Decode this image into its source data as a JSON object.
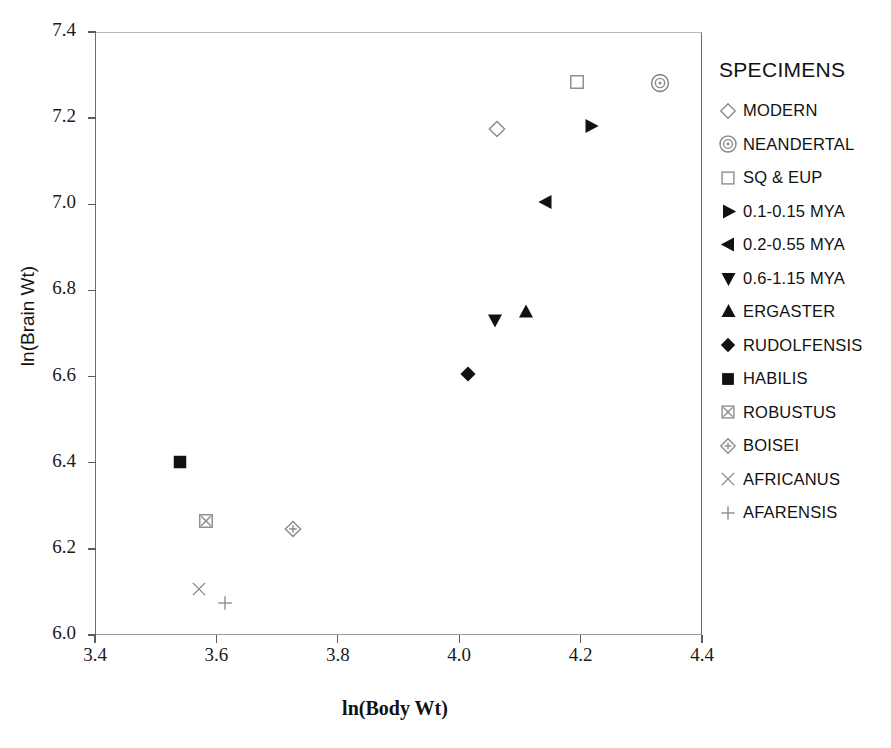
{
  "chart_data": {
    "type": "scatter",
    "title": "",
    "xlabel": "ln(Body Wt)",
    "ylabel": "ln(Brain Wt)",
    "xlim": [
      3.4,
      4.4
    ],
    "ylim": [
      6.0,
      7.4
    ],
    "xticks": [
      "3.4",
      "3.6",
      "3.8",
      "4.0",
      "4.2",
      "4.4"
    ],
    "yticks": [
      "6.0",
      "6.2",
      "6.4",
      "6.6",
      "6.8",
      "7.0",
      "7.2",
      "7.4"
    ],
    "grid": false,
    "legend_position": "right",
    "legend_title": "SPECIMENS",
    "series": [
      {
        "name": "MODERN",
        "marker": "diamond-open",
        "filled": false,
        "points": [
          {
            "x": 4.062,
            "y": 7.17
          }
        ]
      },
      {
        "name": "NEANDERTAL",
        "marker": "circle-target-open",
        "filled": false,
        "points": [
          {
            "x": 4.331,
            "y": 7.277
          }
        ]
      },
      {
        "name": "SQ & EUP",
        "marker": "square-open",
        "filled": false,
        "points": [
          {
            "x": 4.194,
            "y": 7.28
          }
        ]
      },
      {
        "name": "0.1-0.15 MYA",
        "marker": "triangle-right",
        "filled": true,
        "points": [
          {
            "x": 4.217,
            "y": 7.177
          }
        ]
      },
      {
        "name": "0.2-0.55 MYA",
        "marker": "triangle-left",
        "filled": true,
        "points": [
          {
            "x": 4.143,
            "y": 7.001
          }
        ]
      },
      {
        "name": "0.6-1.15 MYA",
        "marker": "triangle-down",
        "filled": true,
        "points": [
          {
            "x": 4.059,
            "y": 6.727
          }
        ]
      },
      {
        "name": "ERGASTER",
        "marker": "triangle-up",
        "filled": true,
        "points": [
          {
            "x": 4.11,
            "y": 6.746
          }
        ]
      },
      {
        "name": "RUDOLFENSIS",
        "marker": "diamond-filled",
        "filled": true,
        "points": [
          {
            "x": 4.014,
            "y": 6.601
          }
        ]
      },
      {
        "name": "HABILIS",
        "marker": "square-filled",
        "filled": true,
        "points": [
          {
            "x": 3.54,
            "y": 6.398
          }
        ]
      },
      {
        "name": "ROBUSTUS",
        "marker": "square-crossed-open",
        "filled": false,
        "points": [
          {
            "x": 3.583,
            "y": 6.26
          }
        ]
      },
      {
        "name": "BOISEI",
        "marker": "diamond-crossed-open",
        "filled": false,
        "points": [
          {
            "x": 3.726,
            "y": 6.241
          }
        ]
      },
      {
        "name": "AFRICANUS",
        "marker": "x-cross",
        "filled": false,
        "points": [
          {
            "x": 3.571,
            "y": 6.103
          }
        ]
      },
      {
        "name": "AFARENSIS",
        "marker": "plus-cross",
        "filled": false,
        "points": [
          {
            "x": 3.614,
            "y": 6.069
          }
        ]
      }
    ]
  },
  "colors": {
    "marker_filled": "#111111",
    "marker_open": "#8a8a8a",
    "axis": "#5c5c5c",
    "text": "#111111",
    "background": "#ffffff"
  }
}
